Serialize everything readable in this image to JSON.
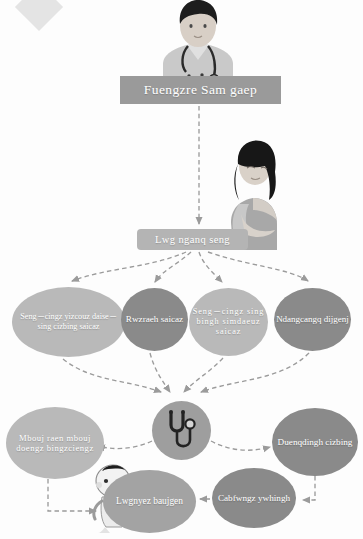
{
  "diagram": {
    "title": "Fuengzre Sam gaep",
    "banners": [
      {
        "id": "primary",
        "text": "Fuengzre Sam gaep"
      },
      {
        "id": "secondary",
        "text": "Lwg nganq seng"
      }
    ],
    "nodes": [
      {
        "id": "prenatal",
        "text": "Seng－cingz yizcouz daise－sing cizbing saicaz",
        "tone": "#b9b9b9"
      },
      {
        "id": "screening",
        "text": "Rwzraeh saicaz",
        "tone": "#8a8a8a"
      },
      {
        "id": "heart",
        "text": "Seng－cingz sing bingh simdaeuz saicaz",
        "tone": "#b9b9b9"
      },
      {
        "id": "checkup",
        "text": "Ndangcangq dijgenj",
        "tone": "#8a8a8a"
      },
      {
        "id": "normal",
        "text": "Mbouj raen mbouj doengz bingzciengz",
        "tone": "#b9b9b9"
      },
      {
        "id": "diagnosis",
        "text": "Duenqdingh cizbing",
        "tone": "#8a8a8a"
      },
      {
        "id": "intervene",
        "text": "Cabfwngz ywhingh",
        "tone": "#8a8a8a"
      },
      {
        "id": "childcare",
        "text": "Lwgnyez baujgen",
        "tone": "#a3a3a3"
      }
    ],
    "hub": {
      "icon": "stethoscope-icon"
    },
    "figures": [
      {
        "id": "doctor",
        "icon": "doctor-illustration"
      },
      {
        "id": "mother",
        "icon": "pregnant-woman-illustration"
      },
      {
        "id": "baby",
        "icon": "baby-illustration"
      }
    ],
    "colors": {
      "background": "#fdfdfd",
      "banner_primary": "#9a9a9a",
      "banner_secondary": "#b4b4b4",
      "node_light": "#b9b9b9",
      "node_mid": "#a3a3a3",
      "node_dark": "#8a8a8a",
      "hub": "#9e9e9e",
      "arrow": "#9b9b9b",
      "label_text": "#ffffff"
    },
    "connectors": [
      {
        "from": "primary-banner",
        "to": "secondary-banner",
        "style": "dashed-arrow"
      },
      {
        "from": "secondary-banner",
        "to": "prenatal",
        "style": "dashed-arrow"
      },
      {
        "from": "secondary-banner",
        "to": "screening",
        "style": "dashed-arrow"
      },
      {
        "from": "secondary-banner",
        "to": "heart",
        "style": "dashed-arrow"
      },
      {
        "from": "secondary-banner",
        "to": "checkup",
        "style": "dashed-arrow"
      },
      {
        "from": "prenatal",
        "to": "hub",
        "style": "dashed-arrow"
      },
      {
        "from": "screening",
        "to": "hub",
        "style": "dashed-arrow"
      },
      {
        "from": "heart",
        "to": "hub",
        "style": "dashed-arrow"
      },
      {
        "from": "checkup",
        "to": "hub",
        "style": "dashed-arrow"
      },
      {
        "from": "hub",
        "to": "normal",
        "style": "dashed-arrow"
      },
      {
        "from": "hub",
        "to": "diagnosis",
        "style": "dashed-arrow"
      },
      {
        "from": "normal",
        "to": "childcare",
        "style": "dashed-arrow"
      },
      {
        "from": "diagnosis",
        "to": "intervene",
        "style": "dashed-arrow"
      },
      {
        "from": "intervene",
        "to": "childcare",
        "style": "dashed-arrow"
      }
    ]
  }
}
